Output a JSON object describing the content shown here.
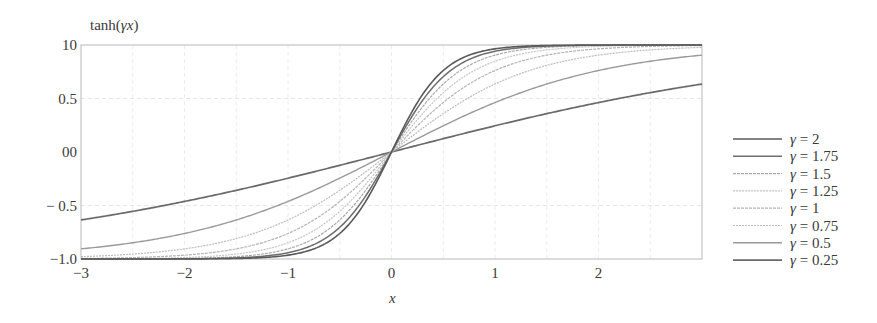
{
  "chart_data": {
    "type": "line",
    "title": "",
    "ylabel": "tanh(γx)",
    "xlabel": "x",
    "xlim": [
      -3,
      3
    ],
    "ylim": [
      -1.0,
      1.0
    ],
    "x_ticks": [
      -3,
      -2,
      -1,
      0,
      1,
      2
    ],
    "x_tick_labels": [
      "−3",
      "−2",
      "−1",
      "0",
      "1",
      "2"
    ],
    "y_ticks": [
      1.0,
      0.5,
      0.0,
      -0.5,
      -1.0
    ],
    "y_tick_labels": [
      "10",
      "0.5",
      "00",
      "− 0.5",
      "−1.0"
    ],
    "grid": true,
    "legend_position": "right",
    "function": "tanh(gamma * x)",
    "series": [
      {
        "name": "γ = 2",
        "gamma": 2,
        "color": "#5a5a5a",
        "width": 1.6,
        "dash": ""
      },
      {
        "name": "γ = 1.75",
        "gamma": 1.75,
        "color": "#6e6e6e",
        "width": 1.5,
        "dash": ""
      },
      {
        "name": "γ = 1.5",
        "gamma": 1.5,
        "color": "#a8a8a8",
        "width": 1.2,
        "dash": "3,1"
      },
      {
        "name": "γ = 1.25",
        "gamma": 1.25,
        "color": "#c4c4c4",
        "width": 1.2,
        "dash": "2,1"
      },
      {
        "name": "γ = 1",
        "gamma": 1,
        "color": "#b4b4b4",
        "width": 1.2,
        "dash": "3,1"
      },
      {
        "name": "γ = 0.75",
        "gamma": 0.75,
        "color": "#bcbcbc",
        "width": 1.2,
        "dash": "2,1"
      },
      {
        "name": "γ = 0.5",
        "gamma": 0.5,
        "color": "#9a9a9a",
        "width": 1.4,
        "dash": ""
      },
      {
        "name": "γ = 0.25",
        "gamma": 0.25,
        "color": "#6a6a6a",
        "width": 1.7,
        "dash": ""
      }
    ],
    "sample_values": {
      "x": [
        -3,
        -2,
        -1,
        0,
        1,
        2,
        3
      ],
      "γ = 2": [
        -0.995,
        -0.999,
        -0.964,
        0,
        0.964,
        0.999,
        0.995
      ],
      "γ = 0.5": [
        -0.905,
        -0.762,
        -0.462,
        0,
        0.462,
        0.762,
        0.905
      ],
      "γ = 0.25": [
        -0.635,
        -0.462,
        -0.245,
        0,
        0.245,
        0.462,
        0.635
      ]
    }
  },
  "layout": {
    "plot": {
      "left": 81,
      "top": 45,
      "right": 702,
      "bottom": 259
    },
    "legend": {
      "line_x1": 733,
      "line_x2": 782,
      "text_x": 790,
      "first_y": 139,
      "spacing": 17.3
    }
  }
}
